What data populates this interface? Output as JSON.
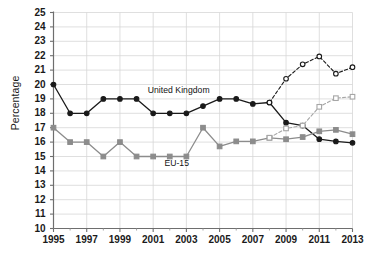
{
  "chart_data": {
    "type": "line",
    "title": "",
    "xlabel": "",
    "ylabel": "Percentage",
    "ylim": [
      10,
      25
    ],
    "xlim": [
      1995,
      2013
    ],
    "grid": true,
    "legend_position": "inline-annotations",
    "y_ticks": [
      10,
      11,
      12,
      13,
      14,
      15,
      16,
      17,
      18,
      19,
      20,
      21,
      22,
      23,
      24,
      25
    ],
    "x_ticks": [
      1995,
      1997,
      1999,
      2001,
      2003,
      2005,
      2007,
      2009,
      2011,
      2013
    ],
    "x_minor_ticks": [
      1996,
      1998,
      2000,
      2002,
      2004,
      2006,
      2008,
      2010,
      2012
    ],
    "x": [
      1995,
      1996,
      1997,
      1998,
      1999,
      2000,
      2001,
      2002,
      2003,
      2004,
      2005,
      2006,
      2007,
      2008,
      2009,
      2010,
      2011,
      2012,
      2013
    ],
    "annotations": [
      {
        "text": "United Kingdom",
        "x": 2002,
        "y": 19.55
      },
      {
        "text": "EU-15",
        "x": 2003,
        "y": 14.45
      }
    ],
    "series": [
      {
        "name": "United Kingdom",
        "color": "#1a1a1a",
        "style": "solid",
        "marker": "filled-circle",
        "x": [
          1995,
          1996,
          1997,
          1998,
          1999,
          2000,
          2001,
          2002,
          2003,
          2004,
          2005,
          2006,
          2007,
          2008,
          2009,
          2010,
          2011,
          2012,
          2013
        ],
        "values": [
          20.0,
          18.0,
          18.0,
          19.0,
          19.0,
          19.0,
          18.0,
          18.0,
          18.0,
          18.5,
          19.0,
          19.0,
          18.65,
          18.75,
          17.35,
          17.15,
          16.2,
          16.05,
          15.95
        ]
      },
      {
        "name": "United Kingdom (revised)",
        "color": "#1a1a1a",
        "style": "dashed",
        "marker": "open-circle",
        "x": [
          2008,
          2009,
          2010,
          2011,
          2012,
          2013
        ],
        "values": [
          18.75,
          20.4,
          21.4,
          21.95,
          20.75,
          21.2
        ]
      },
      {
        "name": "EU-15",
        "color": "#8c8c8c",
        "style": "solid",
        "marker": "filled-square",
        "x": [
          1995,
          1996,
          1997,
          1998,
          1999,
          2000,
          2001,
          2002,
          2003,
          2004,
          2005,
          2006,
          2007,
          2008,
          2009,
          2010,
          2011,
          2012,
          2013
        ],
        "values": [
          17.0,
          16.0,
          16.0,
          15.0,
          16.0,
          15.0,
          15.0,
          15.0,
          15.0,
          17.0,
          15.7,
          16.05,
          16.05,
          16.3,
          16.2,
          16.35,
          16.75,
          16.85,
          16.55
        ]
      },
      {
        "name": "EU-15 (revised)",
        "color": "#a6a6a6",
        "style": "dashed",
        "marker": "open-square",
        "x": [
          2008,
          2009,
          2010,
          2011,
          2012,
          2013
        ],
        "values": [
          16.3,
          16.95,
          17.15,
          18.45,
          19.05,
          19.15
        ]
      }
    ]
  }
}
